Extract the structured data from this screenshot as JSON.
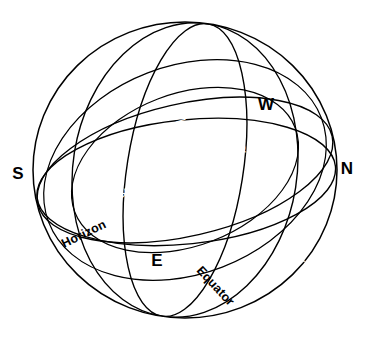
{
  "diagram": {
    "background_color": "#ffffff",
    "ink_color": "#000000",
    "band_fill_color": "#000000",
    "glyph_color": "#ffffff"
  },
  "cardinal_points": [
    {
      "id": "south",
      "label": "S",
      "x": 18,
      "y": 175
    },
    {
      "id": "north",
      "label": "N",
      "x": 347,
      "y": 170
    },
    {
      "id": "east",
      "label": "E",
      "x": 157,
      "y": 262
    },
    {
      "id": "west",
      "label": "W",
      "x": 266,
      "y": 106
    }
  ],
  "great_circles": [
    {
      "id": "horizon",
      "label": "Horizon",
      "label_x": 64,
      "label_y": 248,
      "label_rotation": -26
    },
    {
      "id": "equator",
      "label": "Equator",
      "label_x": 196,
      "label_y": 271,
      "label_rotation": 47
    },
    {
      "id": "ecliptic",
      "label": "",
      "label_x": 0,
      "label_y": 0,
      "label_rotation": 0
    }
  ],
  "zodiac_signs": [
    {
      "order": 1,
      "name": "Aries",
      "glyph": "♈",
      "x": 174,
      "y": 229,
      "rotation": 10
    },
    {
      "order": 2,
      "name": "Taurus",
      "glyph": "♉",
      "x": 238,
      "y": 247,
      "rotation": 8
    },
    {
      "order": 3,
      "name": "Gemini",
      "glyph": "♊",
      "x": 300,
      "y": 258,
      "rotation": -4
    },
    {
      "order": 4,
      "name": "Cancer",
      "glyph": "♋",
      "x": 315,
      "y": 218,
      "rotation": -26
    },
    {
      "order": 5,
      "name": "Leo",
      "glyph": "♌",
      "x": 279,
      "y": 180,
      "rotation": -30
    },
    {
      "order": 6,
      "name": "Virgo",
      "glyph": "♍",
      "x": 240,
      "y": 148,
      "rotation": -28
    },
    {
      "order": 7,
      "name": "Libra",
      "glyph": "♎",
      "x": 180,
      "y": 118,
      "rotation": -16
    },
    {
      "order": 8,
      "name": "Scorpio",
      "glyph": "♏",
      "x": 133,
      "y": 100,
      "rotation": -6
    },
    {
      "order": 9,
      "name": "Sagittarius",
      "glyph": "♐",
      "x": 81,
      "y": 90,
      "rotation": 12
    },
    {
      "order": 10,
      "name": "Capricorn",
      "glyph": "♑",
      "x": 57,
      "y": 124,
      "rotation": 30
    },
    {
      "order": 11,
      "name": "Aquarius",
      "glyph": "♒",
      "x": 89,
      "y": 163,
      "rotation": 22
    },
    {
      "order": 12,
      "name": "Pisces",
      "glyph": "♓",
      "x": 126,
      "y": 195,
      "rotation": 16
    }
  ]
}
